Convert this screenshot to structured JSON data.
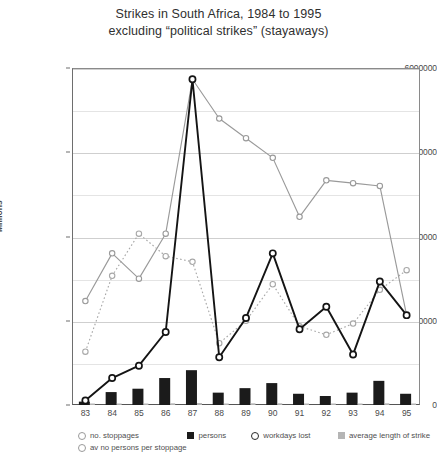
{
  "title": {
    "line1": "Strikes in South Africa, 1984 to 1995",
    "line2": "excluding “political strikes” (stayaways)"
  },
  "axis": {
    "y_title": "Millions",
    "y_ticks": [
      "0",
      "1500000",
      "3000000",
      "4500000",
      "6000000"
    ]
  },
  "legend": {
    "items": [
      {
        "label": "no. stoppages",
        "marker": "open-circle-gray"
      },
      {
        "label": "av no persons per stoppage",
        "marker": "open-circle-gray-dotted"
      },
      {
        "label": "persons",
        "marker": "black-square"
      },
      {
        "label": "workdays lost",
        "marker": "open-circle-dark"
      },
      {
        "label": "average length of strike",
        "marker": "gray-square"
      }
    ]
  },
  "colors": {
    "stoppages_line": "#9a9a9a",
    "av_persons_line": "#a8a8a8",
    "workdays_line": "#141414",
    "persons_bar": "#1b1b1b",
    "avg_length_bar": "#b5b5b5",
    "gridline": "#e4e4e4",
    "axis": "#6e6e6e",
    "text": "#4a4a4a"
  },
  "chart_data": {
    "type": "line",
    "title": "Strikes in South Africa, 1984 to 1995 excluding “political strikes” (stayaways)",
    "xlabel": "",
    "ylabel": "Millions",
    "ylim": [
      0,
      6000000
    ],
    "ytick_values": [
      0,
      1500000,
      3000000,
      4500000,
      6000000
    ],
    "grid": true,
    "minor_gridlines": [
      750000,
      2250000,
      3750000,
      5250000
    ],
    "legend_position": "bottom",
    "categories": [
      "83",
      "84",
      "85",
      "86",
      "87",
      "88",
      "89",
      "90",
      "91",
      "92",
      "93",
      "94",
      "95"
    ],
    "series": [
      {
        "name": "no. stoppages",
        "type": "line",
        "marker": "open-circle",
        "color": "#9a9a9a",
        "style": "solid",
        "values": [
          1850000,
          2700000,
          2250000,
          3050000,
          5800000,
          5100000,
          4750000,
          4400000,
          3350000,
          4000000,
          3950000,
          3900000,
          1600000
        ]
      },
      {
        "name": "av no persons per stoppage",
        "type": "line",
        "marker": "open-circle",
        "color": "#a8a8a8",
        "style": "dotted",
        "values": [
          950000,
          2300000,
          3050000,
          2650000,
          2550000,
          1100000,
          1500000,
          2150000,
          1400000,
          1250000,
          1450000,
          2050000,
          2400000
        ]
      },
      {
        "name": "workdays lost",
        "type": "line",
        "marker": "open-circle",
        "color": "#141414",
        "style": "solid",
        "values": [
          80000,
          480000,
          700000,
          1300000,
          5800000,
          850000,
          1550000,
          2700000,
          1350000,
          1750000,
          900000,
          2200000,
          1600000
        ]
      },
      {
        "name": "persons",
        "type": "bar",
        "color": "#1b1b1b",
        "values": [
          60000,
          230000,
          290000,
          480000,
          620000,
          220000,
          300000,
          390000,
          200000,
          160000,
          220000,
          430000,
          200000
        ]
      },
      {
        "name": "average length of strike",
        "type": "bar",
        "color": "#b5b5b5",
        "values": [
          20000,
          25000,
          25000,
          30000,
          35000,
          25000,
          30000,
          30000,
          25000,
          25000,
          25000,
          30000,
          25000
        ]
      }
    ]
  }
}
